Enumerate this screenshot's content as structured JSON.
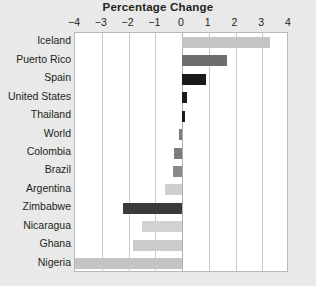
{
  "chart_data": {
    "type": "bar",
    "orientation": "horizontal",
    "title": "Percentage Change",
    "xlabel": "",
    "ylabel": "",
    "xlim": [
      -4,
      4
    ],
    "xticks": [
      -4,
      -3,
      -2,
      -1,
      0,
      1,
      2,
      3,
      4
    ],
    "xtick_labels": [
      "−4",
      "−3",
      "−2",
      "−1",
      "0",
      "1",
      "2",
      "3",
      "4"
    ],
    "grid": true,
    "legend": false,
    "categories": [
      "Iceland",
      "Puerto Rico",
      "Spain",
      "United States",
      "Thailand",
      "World",
      "Colombia",
      "Brazil",
      "Argentina",
      "Zimbabwe",
      "Nicaragua",
      "Ghana",
      "Nigeria"
    ],
    "values": [
      3.3,
      1.7,
      0.9,
      0.2,
      0.1,
      -0.12,
      -0.3,
      -0.35,
      -0.62,
      -2.2,
      -1.5,
      -1.85,
      -4.0
    ],
    "bar_colors": [
      "#c4c4c4",
      "#6e6e6e",
      "#1a1a1a",
      "#1a1a1a",
      "#1a1a1a",
      "#7d7d7d",
      "#7d7d7d",
      "#8a8a8a",
      "#cfcfcf",
      "#3a3a3a",
      "#d2d2d2",
      "#cbcbcb",
      "#c4c4c4"
    ]
  },
  "style": {
    "background_color": "#e9e9e9",
    "plot_background_color": "#ffffff",
    "gridline_color": "#c9c9c9",
    "zero_line_color": "#b0b0b0",
    "text_color": "#231f20",
    "light_bar_color": "#c4c4c4",
    "medium_bar_color": "#7d7d7d",
    "dark_bar_color": "#1a1a1a"
  }
}
